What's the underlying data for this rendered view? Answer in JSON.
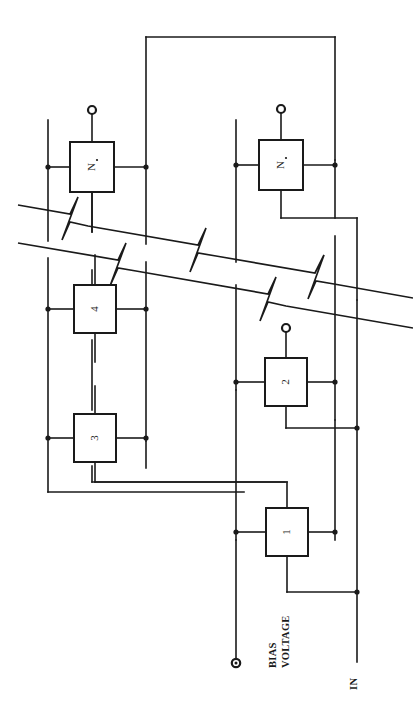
{
  "figure": {
    "type": "circuit-schematic",
    "orientation": "rotated-90-ccw",
    "background_color": "#ffffff",
    "line_color": "#1a1a1a"
  },
  "stages": [
    {
      "id": "stage-1",
      "label": "1"
    },
    {
      "id": "stage-2",
      "label": "2"
    },
    {
      "id": "stage-3",
      "label": "3"
    },
    {
      "id": "stage-4",
      "label": "4"
    },
    {
      "id": "stage-n-minus-1",
      "label": "N",
      "sublabel": "-1"
    },
    {
      "id": "stage-n",
      "label": "N",
      "sublabel": ""
    }
  ],
  "ports": [
    {
      "id": "bias-voltage",
      "label_line1": "BIAS",
      "label_line2": "VOLTAGE"
    },
    {
      "id": "input",
      "label": "IN"
    }
  ],
  "terminals": [
    {
      "id": "terminal-stage-n-top"
    },
    {
      "id": "terminal-stage-n-minus-1-top"
    },
    {
      "id": "terminal-stage-2-top"
    },
    {
      "id": "terminal-bias-voltage"
    }
  ],
  "break_band": {
    "id": "omitted-stages-break",
    "style": "double-diagonal-zigzag",
    "meaning": "repeated stages omitted"
  }
}
